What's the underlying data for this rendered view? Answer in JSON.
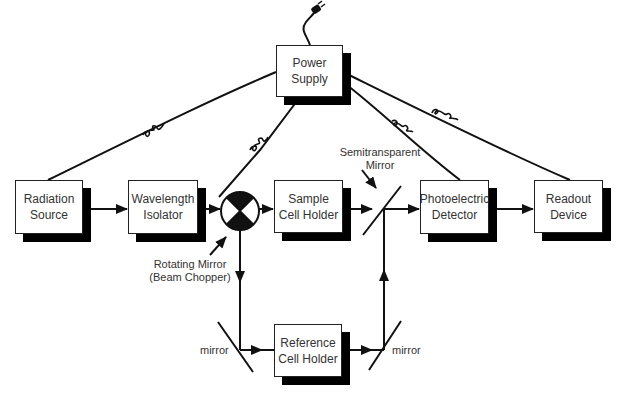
{
  "diagram": {
    "colors": {
      "line": "#111111",
      "box_border": "#222222",
      "shadow": "#000000",
      "text": "#333333"
    },
    "boxes": [
      {
        "id": "power_supply",
        "line1": "Power",
        "line2": "Supply"
      },
      {
        "id": "radiation_source",
        "line1": "Radiation",
        "line2": "Source"
      },
      {
        "id": "wavelength_isolator",
        "line1": "Wavelength",
        "line2": "Isolator"
      },
      {
        "id": "sample_cell_holder",
        "line1": "Sample",
        "line2": "Cell Holder"
      },
      {
        "id": "photoelectric_detector",
        "line1": "Photoelectric",
        "line2": "Detector"
      },
      {
        "id": "readout_device",
        "line1": "Readout",
        "line2": "Device"
      },
      {
        "id": "reference_cell_holder",
        "line1": "Reference",
        "line2": "Cell Holder"
      }
    ],
    "labels": {
      "semitransparent_mirror_1": "Semitransparent",
      "semitransparent_mirror_2": "Mirror",
      "rotating_mirror_1": "Rotating Mirror",
      "rotating_mirror_2": "(Beam Chopper)",
      "mirror_left": "mirror",
      "mirror_right": "mirror"
    },
    "icons": {
      "plug": "power-plug-icon",
      "chopper": "beam-chopper-icon",
      "coil": "coiled-wire-icon"
    }
  }
}
